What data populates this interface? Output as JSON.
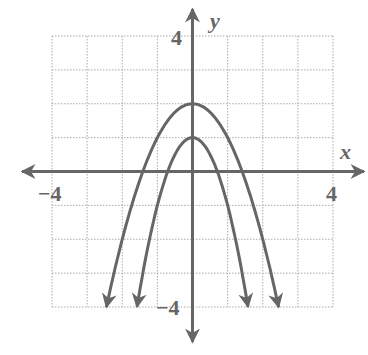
{
  "chart_data": {
    "type": "line",
    "title": "",
    "xlabel": "x",
    "ylabel": "y",
    "xlim": [
      -4,
      4
    ],
    "ylim": [
      -4,
      4
    ],
    "grid": true,
    "grid_style": "dotted",
    "tick_labels": {
      "x": [
        "-4",
        "4"
      ],
      "y": [
        "4",
        "-4"
      ]
    },
    "series": [
      {
        "name": "y = -x^2 + 2",
        "vertex": [
          0,
          2
        ],
        "x_intercepts": [
          -1.414,
          1.414
        ],
        "domain": [
          -2.45,
          2.45
        ],
        "ends_with_arrows": true
      },
      {
        "name": "y = -2x^2 + 1",
        "vertex": [
          0,
          1
        ],
        "x_intercepts": [
          -0.707,
          0.707
        ],
        "domain": [
          -1.58,
          1.58
        ],
        "ends_with_arrows": true
      }
    ]
  },
  "labels": {
    "x_axis": "x",
    "y_axis": "y",
    "x_min": "−4",
    "x_max": "4",
    "y_max": "4",
    "y_min": "−4"
  },
  "colors": {
    "curve": "#666666",
    "axis": "#666666",
    "grid": "#aaaaaa",
    "background": "#ffffff"
  }
}
